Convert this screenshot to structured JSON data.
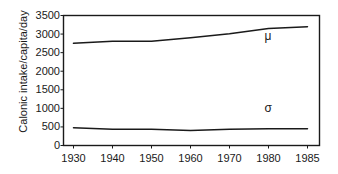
{
  "chart_data": {
    "type": "line",
    "title": "",
    "xlabel": "",
    "ylabel": "Calonic intake/capita/day",
    "categories": [
      "1930",
      "1940",
      "1950",
      "1960",
      "1970",
      "1980",
      "1985"
    ],
    "x": [
      1930,
      1940,
      1950,
      1960,
      1970,
      1980,
      1985
    ],
    "series": [
      {
        "name": "μ",
        "values": [
          2750,
          2810,
          2805,
          2900,
          3010,
          3150,
          3200
        ]
      },
      {
        "name": "σ",
        "values": [
          480,
          440,
          440,
          405,
          440,
          450,
          450
        ]
      }
    ],
    "ylim": [
      0,
      3500
    ],
    "yticks": [
      0,
      500,
      1000,
      1500,
      2000,
      2500,
      3000,
      3500
    ],
    "ytick_labels": [
      "0",
      "500",
      "1000",
      "1500",
      "2000",
      "2500",
      "3000",
      "3500"
    ],
    "xtick_labels": [
      "1930",
      "1940",
      "1950",
      "1960",
      "1970",
      "1980",
      "1985"
    ],
    "grid": false,
    "legend": "inline-annotations",
    "annotations": [
      {
        "text": "μ",
        "x": 1980,
        "y": 2960
      },
      {
        "text": "σ",
        "x": 1980,
        "y": 1000
      }
    ],
    "colors": {
      "background": "#ffffff",
      "axis": "#1a1a1a",
      "series_mu": "#1a1a1a",
      "series_sigma": "#1a1a1a",
      "text": "#1a1a1a"
    }
  }
}
